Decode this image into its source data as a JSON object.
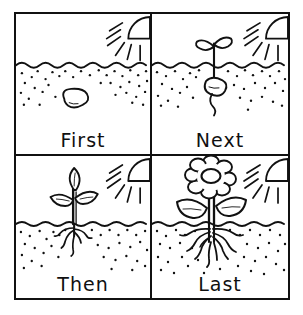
{
  "worksheet": {
    "title": "Plant Life Cycle Sequence",
    "layout": "2x2 grid of sequence panels",
    "ink_color": "#111111",
    "background_color": "#ffffff",
    "border_style": "solid black rectangle with cross divider"
  },
  "panels": [
    {
      "id": "panel-first",
      "label": "First",
      "stage": "seed",
      "position": "top-left",
      "scene": {
        "sun": "quarter-sun-top-right-with-rays",
        "ray_count": 6,
        "ground_line": "wavy",
        "soil_texture": "scattered dots",
        "plant_parts": [
          "bean seed underground"
        ],
        "leaf_count": 0,
        "root_count": 0,
        "has_flower": false
      }
    },
    {
      "id": "panel-next",
      "label": "Next",
      "stage": "sprout",
      "position": "top-right",
      "scene": {
        "sun": "quarter-sun-top-right-with-rays",
        "ray_count": 6,
        "ground_line": "wavy",
        "soil_texture": "scattered dots",
        "plant_parts": [
          "seed underground",
          "single root",
          "stem",
          "two cotyledon leaves"
        ],
        "leaf_count": 2,
        "root_count": 1,
        "has_flower": false
      }
    },
    {
      "id": "panel-then",
      "label": "Then",
      "stage": "seedling",
      "position": "bottom-left",
      "scene": {
        "sun": "quarter-sun-top-right-with-rays",
        "ray_count": 6,
        "ground_line": "wavy",
        "soil_texture": "scattered dots",
        "plant_parts": [
          "branching roots",
          "stem",
          "three leaves"
        ],
        "leaf_count": 3,
        "root_count": 5,
        "has_flower": false
      }
    },
    {
      "id": "panel-last",
      "label": "Last",
      "stage": "flowering plant",
      "position": "bottom-right",
      "scene": {
        "sun": "quarter-sun-top-right-with-rays",
        "ray_count": 6,
        "ground_line": "wavy",
        "soil_texture": "scattered dots",
        "plant_parts": [
          "dense branching roots",
          "stem",
          "two large leaves",
          "flower with petals"
        ],
        "leaf_count": 2,
        "root_count": 9,
        "petal_count": 8,
        "has_flower": true
      }
    }
  ]
}
